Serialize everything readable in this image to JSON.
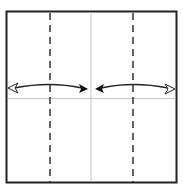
{
  "diagram": {
    "type": "origami-fold-diagram",
    "paper": {
      "x": 6,
      "y": 11,
      "width": 170,
      "height": 172,
      "border_color": "#222222"
    },
    "crease_lines": [
      {
        "kind": "vertical-center",
        "x": 91,
        "color": "#aaaaaa"
      },
      {
        "kind": "horizontal-center",
        "y": 98,
        "color": "#aaaaaa"
      }
    ],
    "valley_folds": [
      {
        "x": 50,
        "style": "dashed"
      },
      {
        "x": 133,
        "style": "dashed"
      }
    ],
    "arrows": [
      {
        "name": "left-fold-arrow",
        "from_x": 8,
        "to_x": 88,
        "y": 88,
        "tail": "open",
        "head": "filled"
      },
      {
        "name": "right-fold-arrow",
        "from_x": 174,
        "to_x": 95,
        "y": 88,
        "tail": "open",
        "head": "filled"
      }
    ]
  }
}
